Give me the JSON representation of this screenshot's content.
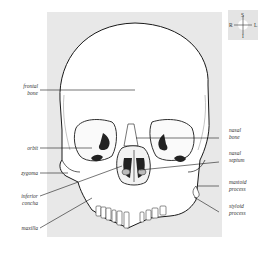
{
  "figure": {
    "compass": {
      "top": "S",
      "left": "R",
      "right": "L",
      "bottom": "I"
    },
    "labels_left": [
      {
        "id": "frontal-bone",
        "lines": [
          "frontal",
          "bone"
        ]
      },
      {
        "id": "orbit",
        "lines": [
          "orbit"
        ]
      },
      {
        "id": "zygoma",
        "lines": [
          "zygoma"
        ]
      },
      {
        "id": "inferior-concha",
        "lines": [
          "inferior",
          "concha"
        ]
      },
      {
        "id": "maxilla",
        "lines": [
          "maxilla"
        ]
      }
    ],
    "labels_right": [
      {
        "id": "nasal-bone",
        "lines": [
          "nasal",
          "bone"
        ]
      },
      {
        "id": "nasal-septum",
        "lines": [
          "nasal",
          "septum"
        ]
      },
      {
        "id": "mastoid-process",
        "lines": [
          "mastoid",
          "process"
        ]
      },
      {
        "id": "styloid-process",
        "lines": [
          "styloid",
          "process"
        ]
      }
    ],
    "colors": {
      "panel": "#e8e8e8",
      "line": "#1a1a1a",
      "cavity": "#222222",
      "bone": "#ffffff"
    }
  }
}
